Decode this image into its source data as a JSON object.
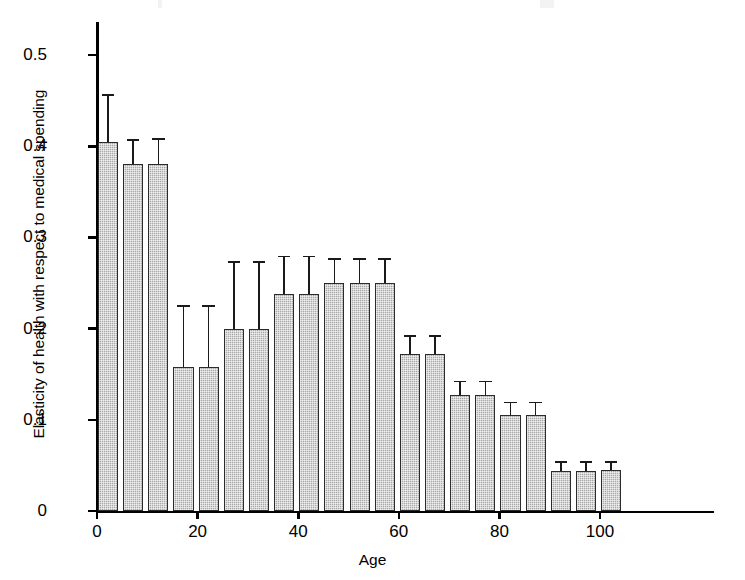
{
  "figure": {
    "xlabel": "Age",
    "ylabel": "Elasticity of health with respect to medical spending"
  },
  "axes": {
    "y_ticks": [
      "0",
      "0.1",
      "0.2",
      "0.3",
      "0.4",
      "0.5"
    ],
    "x_ticks": [
      "0",
      "20",
      "40",
      "60",
      "80",
      "100"
    ]
  },
  "chart_data": {
    "type": "bar",
    "title": "",
    "xlabel": "Age",
    "ylabel": "Elasticity of health with respect to medical spending",
    "xlim": [
      0,
      106
    ],
    "ylim": [
      0,
      0.54
    ],
    "grid": false,
    "legend": "none",
    "bar_width_years": 4,
    "error_bars": "upper only, with caps",
    "categories": [
      0,
      5,
      10,
      15,
      20,
      25,
      30,
      35,
      40,
      45,
      50,
      55,
      60,
      65,
      70,
      75,
      80,
      85,
      90,
      95,
      100
    ],
    "xtick_labels": [
      "0",
      "20",
      "40",
      "60",
      "80",
      "100"
    ],
    "ytick_labels": [
      "0",
      "0.1",
      "0.2",
      "0.3",
      "0.4",
      "0.5"
    ],
    "values": [
      0.405,
      0.381,
      0.381,
      0.158,
      0.158,
      0.2,
      0.2,
      0.238,
      0.238,
      0.25,
      0.25,
      0.25,
      0.172,
      0.172,
      0.127,
      0.127,
      0.105,
      0.105,
      0.044,
      0.044,
      0.045
    ],
    "upper_errors": [
      0.457,
      0.408,
      0.409,
      0.226,
      0.226,
      0.274,
      0.274,
      0.28,
      0.28,
      0.277,
      0.277,
      0.277,
      0.193,
      0.193,
      0.143,
      0.143,
      0.12,
      0.12,
      0.055,
      0.055,
      0.055
    ],
    "bar_fill_color": "#a8a8a8",
    "bar_edge_color": "#2b2b2b"
  }
}
